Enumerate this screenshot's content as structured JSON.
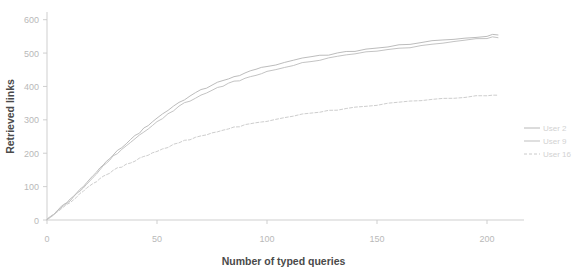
{
  "chart_data": {
    "type": "line",
    "title": "",
    "xlabel": "Number of typed queries",
    "ylabel": "Retrieved links",
    "xlim": [
      0,
      215
    ],
    "ylim": [
      0,
      620
    ],
    "xticks": [
      0,
      50,
      100,
      150,
      200
    ],
    "yticks": [
      0,
      100,
      200,
      300,
      400,
      500,
      600
    ],
    "xtick_labels": [
      "0",
      "50",
      "100",
      "150",
      "200"
    ],
    "ytick_labels": [
      "0",
      "100",
      "200",
      "300",
      "400",
      "500",
      "600"
    ],
    "grid": false,
    "legend_position": "right",
    "series": [
      {
        "name": "User 2",
        "color": "#b0b0b0",
        "style": "solid",
        "x": [
          0,
          3,
          6,
          9,
          12,
          15,
          18,
          21,
          24,
          27,
          30,
          34,
          38,
          42,
          46,
          50,
          55,
          60,
          65,
          70,
          75,
          80,
          85,
          90,
          95,
          100,
          108,
          116,
          124,
          132,
          140,
          150,
          160,
          170,
          180,
          190,
          200,
          205
        ],
        "y": [
          0,
          18,
          36,
          52,
          70,
          92,
          112,
          132,
          155,
          176,
          196,
          218,
          240,
          262,
          284,
          305,
          330,
          352,
          372,
          390,
          405,
          418,
          430,
          440,
          450,
          459,
          472,
          483,
          492,
          500,
          507,
          516,
          524,
          531,
          538,
          545,
          552,
          556
        ]
      },
      {
        "name": "User 9",
        "color": "#b8b8b8",
        "style": "solid",
        "x": [
          0,
          3,
          6,
          9,
          12,
          15,
          18,
          21,
          24,
          27,
          30,
          34,
          38,
          42,
          46,
          50,
          55,
          60,
          65,
          70,
          75,
          80,
          85,
          90,
          95,
          100,
          108,
          116,
          124,
          132,
          140,
          150,
          160,
          170,
          180,
          190,
          200,
          205
        ],
        "y": [
          0,
          16,
          34,
          50,
          68,
          88,
          108,
          128,
          150,
          170,
          190,
          212,
          233,
          254,
          274,
          294,
          318,
          340,
          358,
          375,
          390,
          402,
          414,
          425,
          435,
          444,
          458,
          470,
          480,
          489,
          497,
          506,
          514,
          522,
          530,
          537,
          544,
          548
        ]
      },
      {
        "name": "User 16",
        "color": "#c4c4c4",
        "style": "dashed",
        "x": [
          0,
          3,
          6,
          9,
          12,
          15,
          18,
          21,
          24,
          27,
          30,
          34,
          38,
          42,
          46,
          50,
          55,
          60,
          65,
          70,
          75,
          80,
          85,
          90,
          95,
          100,
          108,
          116,
          124,
          132,
          140,
          150,
          160,
          170,
          180,
          190,
          200,
          205
        ],
        "y": [
          0,
          15,
          30,
          46,
          62,
          80,
          96,
          110,
          124,
          136,
          148,
          160,
          172,
          184,
          195,
          206,
          219,
          231,
          242,
          252,
          261,
          269,
          277,
          284,
          291,
          297,
          307,
          316,
          323,
          330,
          336,
          344,
          351,
          357,
          363,
          368,
          373,
          375
        ]
      }
    ]
  },
  "legend": {
    "entries": [
      {
        "label": "User 2"
      },
      {
        "label": "User 9"
      },
      {
        "label": "User 16"
      }
    ]
  },
  "axes": {
    "x_title": "Number of typed queries",
    "y_title": "Retrieved links"
  }
}
